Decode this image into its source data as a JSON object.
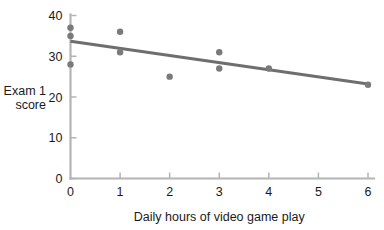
{
  "chart_data": {
    "type": "scatter",
    "title": "",
    "xlabel": "Daily hours of video game play",
    "ylabel_line1": "Exam 1",
    "ylabel_line2": "score",
    "xlim": [
      0,
      6
    ],
    "ylim": [
      0,
      40
    ],
    "xticks": [
      0,
      1,
      2,
      3,
      4,
      5,
      6
    ],
    "xticklabels": [
      "0",
      "1",
      "2",
      "3",
      "4",
      "5",
      "6"
    ],
    "yticks": [
      0,
      10,
      20,
      30,
      40
    ],
    "yticklabels": [
      "0",
      "10",
      "20",
      "30",
      "40"
    ],
    "grid": false,
    "legend": "none",
    "points": [
      {
        "x": 0.0,
        "y": 37.0
      },
      {
        "x": 0.0,
        "y": 35.0
      },
      {
        "x": 0.0,
        "y": 28.0
      },
      {
        "x": 1.0,
        "y": 36.0
      },
      {
        "x": 1.0,
        "y": 31.0
      },
      {
        "x": 2.0,
        "y": 25.0
      },
      {
        "x": 3.0,
        "y": 31.0
      },
      {
        "x": 3.0,
        "y": 27.0
      },
      {
        "x": 4.0,
        "y": 27.0
      },
      {
        "x": 6.0,
        "y": 23.0
      }
    ],
    "marker_color": "#7a7a7a",
    "marker_radius": 3.2,
    "trendline": {
      "type": "line",
      "x_start": 0.0,
      "y_start": 33.7,
      "x_end": 6.0,
      "y_end": 23.2,
      "color": "#6e6e6e",
      "width": 3.1
    },
    "axis_color": "#b4b4b4"
  }
}
